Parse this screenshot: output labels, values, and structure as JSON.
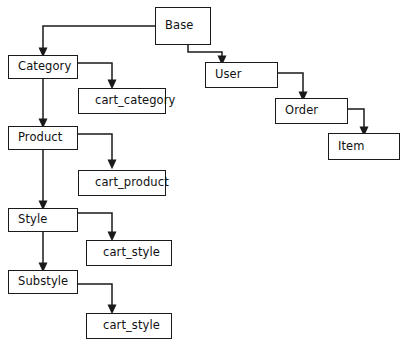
{
  "diagram": {
    "type": "class-hierarchy-diagram",
    "style": {
      "box_border_color": "#1a1a1a",
      "box_fill_color": "#ffffff",
      "connector_color": "#1a1a1a",
      "label_color": "#111111",
      "background_color": "#ffffff"
    },
    "nodes": [
      {
        "id": "base",
        "label": "Base",
        "kind": "class",
        "x": 155,
        "y": 7,
        "w": 56,
        "h": 38
      },
      {
        "id": "category",
        "label": "Category",
        "kind": "class",
        "x": 8,
        "y": 55,
        "w": 70,
        "h": 24
      },
      {
        "id": "cart_category",
        "label": "cart_category",
        "kind": "table",
        "x": 78,
        "y": 88,
        "w": 88,
        "h": 26
      },
      {
        "id": "product",
        "label": "Product",
        "kind": "class",
        "x": 8,
        "y": 126,
        "w": 70,
        "h": 24
      },
      {
        "id": "cart_product",
        "label": "cart_product",
        "kind": "table",
        "x": 78,
        "y": 170,
        "w": 88,
        "h": 26
      },
      {
        "id": "style",
        "label": "Style",
        "kind": "class",
        "x": 8,
        "y": 208,
        "w": 70,
        "h": 24
      },
      {
        "id": "cart_style_1",
        "label": "cart_style",
        "kind": "table",
        "x": 86,
        "y": 240,
        "w": 86,
        "h": 26
      },
      {
        "id": "substyle",
        "label": "Substyle",
        "kind": "class",
        "x": 8,
        "y": 270,
        "w": 70,
        "h": 24
      },
      {
        "id": "cart_style_2",
        "label": "cart_style",
        "kind": "table",
        "x": 86,
        "y": 313,
        "w": 86,
        "h": 26
      },
      {
        "id": "user",
        "label": "User",
        "kind": "class",
        "x": 205,
        "y": 62,
        "w": 73,
        "h": 26
      },
      {
        "id": "order",
        "label": "Order",
        "kind": "class",
        "x": 275,
        "y": 98,
        "w": 73,
        "h": 26
      },
      {
        "id": "item",
        "label": "Item",
        "kind": "class",
        "x": 328,
        "y": 133,
        "w": 72,
        "h": 27
      }
    ],
    "connectors": [
      {
        "id": "base-to-category",
        "from": "base",
        "to": "category",
        "path": "M 155 26 L 43 26 L 43 48"
      },
      {
        "id": "base-to-user",
        "from": "base",
        "to": "user",
        "path": "M 188 45 L 188 52 L 222 52 L 222 56"
      },
      {
        "id": "category-to-cart",
        "from": "category",
        "to": "cart_category",
        "path": "M 78 63 L 112 63 L 112 80"
      },
      {
        "id": "category-to-product",
        "from": "category",
        "to": "product",
        "path": "M 43 79 L 43 119"
      },
      {
        "id": "product-to-cart",
        "from": "product",
        "to": "cart_product",
        "path": "M 78 134 L 112 134 L 112 160"
      },
      {
        "id": "product-to-style",
        "from": "product",
        "to": "style",
        "path": "M 43 150 L 43 201"
      },
      {
        "id": "style-to-cart",
        "from": "style",
        "to": "cart_style_1",
        "path": "M 78 213 L 112 213 L 112 232"
      },
      {
        "id": "style-to-substyle",
        "from": "style",
        "to": "substyle",
        "path": "M 43 232 L 43 263"
      },
      {
        "id": "substyle-to-cart",
        "from": "substyle",
        "to": "cart_style_2",
        "path": "M 78 284 L 112 284 L 112 305"
      },
      {
        "id": "user-to-order",
        "from": "user",
        "to": "order",
        "path": "M 278 73 L 303 73 L 303 92"
      },
      {
        "id": "order-to-item",
        "from": "order",
        "to": "item",
        "path": "M 348 109 L 364 109 L 364 127"
      }
    ]
  }
}
